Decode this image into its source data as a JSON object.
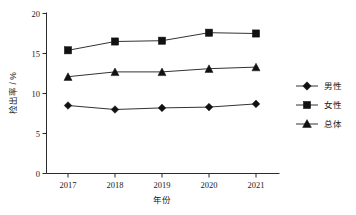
{
  "chart_data": {
    "type": "line",
    "title": "",
    "xlabel": "年份",
    "ylabel": "检出率 / %",
    "categories": [
      "2017",
      "2018",
      "2019",
      "2020",
      "2021"
    ],
    "x_tick_labels": [
      "2017",
      "2018",
      "2019",
      "2020",
      "2021"
    ],
    "y_tick_labels": [
      "0",
      "5",
      "10",
      "15",
      "20"
    ],
    "y_ticks": [
      0,
      5,
      10,
      15,
      20
    ],
    "ylim": [
      0,
      20
    ],
    "grid": false,
    "legend_position": "right",
    "series": [
      {
        "name": "男性",
        "marker": "diamond",
        "color": "#111111",
        "values": [
          8.5,
          8.0,
          8.2,
          8.3,
          8.7
        ]
      },
      {
        "name": "女性",
        "marker": "square",
        "color": "#111111",
        "values": [
          15.4,
          16.5,
          16.6,
          17.6,
          17.5
        ]
      },
      {
        "name": "总体",
        "marker": "triangle",
        "color": "#111111",
        "values": [
          12.1,
          12.7,
          12.7,
          13.1,
          13.3
        ]
      }
    ]
  },
  "axes": {
    "y_title": "检出率 / %",
    "x_title": "年份",
    "y_tick_0": "0",
    "y_tick_1": "5",
    "y_tick_2": "10",
    "y_tick_3": "15",
    "y_tick_4": "20",
    "x_tick_0": "2017",
    "x_tick_1": "2018",
    "x_tick_2": "2019",
    "x_tick_3": "2020",
    "x_tick_4": "2021"
  },
  "legend": {
    "items": [
      {
        "label": "男性",
        "marker": "diamond-marker"
      },
      {
        "label": "女性",
        "marker": "square-marker"
      },
      {
        "label": "总体",
        "marker": "triangle-marker"
      }
    ]
  }
}
